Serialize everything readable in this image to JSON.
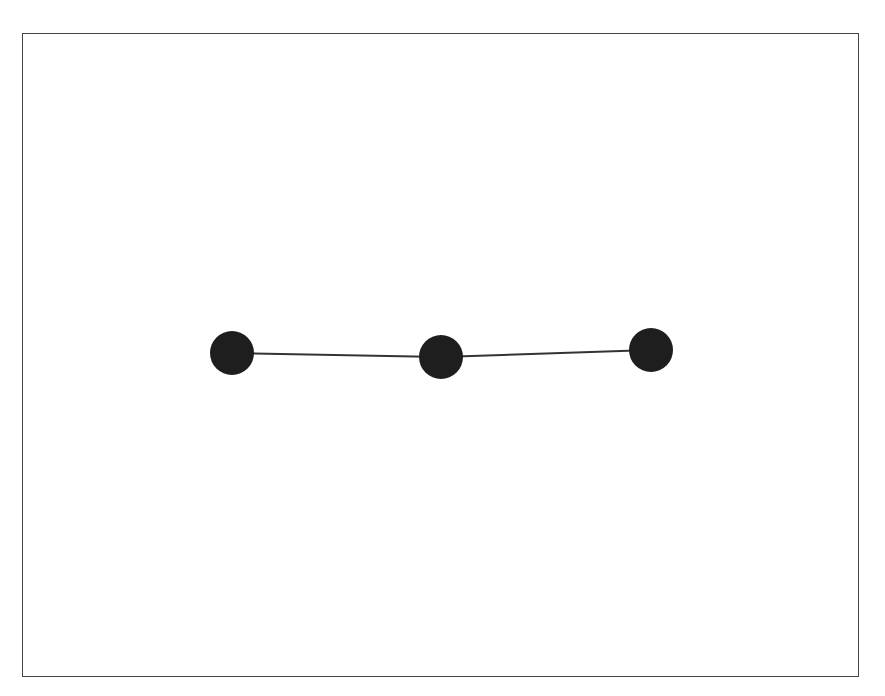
{
  "diagram": {
    "type": "graph",
    "frame": {
      "x": 22,
      "y": 33,
      "width": 837,
      "height": 644,
      "border_color": "#444444"
    },
    "node_color": "#1e1e1e",
    "edge_color": "#333333",
    "nodes": [
      {
        "id": "n1",
        "x": 232,
        "y": 353,
        "r": 22
      },
      {
        "id": "n2",
        "x": 441,
        "y": 357,
        "r": 22
      },
      {
        "id": "n3",
        "x": 651,
        "y": 350,
        "r": 22
      }
    ],
    "edges": [
      {
        "from": "n1",
        "to": "n2"
      },
      {
        "from": "n2",
        "to": "n3"
      }
    ]
  }
}
